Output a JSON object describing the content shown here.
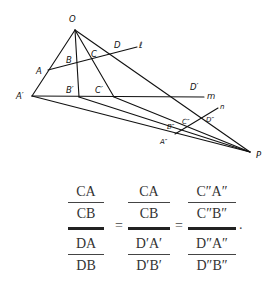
{
  "figure": {
    "points": {
      "O": "O",
      "A": "A",
      "B": "B",
      "C": "C",
      "D": "D",
      "A_prime": "A′",
      "B_prime": "B′",
      "C_prime": "C′",
      "D_prime": "D′",
      "A_dprime": "A″",
      "B_dprime": "B″",
      "C_dprime": "C″",
      "D_dprime": "D″",
      "P": "P"
    },
    "lines": {
      "l": "ℓ",
      "m": "m",
      "n": "n"
    }
  },
  "equation": {
    "frac1": {
      "num_top": "CA",
      "num_bottom": "CB",
      "den_top": "DA",
      "den_bottom": "DB"
    },
    "frac2": {
      "num_top": "CA",
      "num_bottom": "CB",
      "den_top": "D′A′",
      "den_bottom": "D′B′"
    },
    "frac3": {
      "num_top": "C″A″",
      "num_bottom": "C″B″",
      "den_top": "D″A″",
      "den_bottom": "D″B″"
    },
    "equals": "=",
    "terminator": "."
  }
}
